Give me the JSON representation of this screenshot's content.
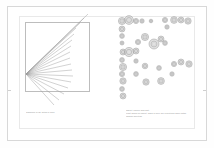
{
  "document": {
    "title": "Figure page",
    "background_color": "#ffffff",
    "frame_color": "#d8d8d8"
  },
  "left_panel": {
    "name": "ray-diagram-panel",
    "box": {
      "stroke_color": "#bdbdbd",
      "fill_color": "#ffffff"
    },
    "ray_origin": {
      "x": 12,
      "y": 62
    },
    "ray_color": "#9a9a9a",
    "rays": [
      {
        "x2": 74,
        "y2": 2
      },
      {
        "x2": 70,
        "y2": 6
      },
      {
        "x2": 66,
        "y2": 11
      },
      {
        "x2": 62,
        "y2": 16
      },
      {
        "x2": 60,
        "y2": 22
      },
      {
        "x2": 58,
        "y2": 28
      },
      {
        "x2": 57,
        "y2": 34
      },
      {
        "x2": 56,
        "y2": 40
      },
      {
        "x2": 56,
        "y2": 46
      },
      {
        "x2": 57,
        "y2": 52
      },
      {
        "x2": 58,
        "y2": 58
      },
      {
        "x2": 59,
        "y2": 64
      },
      {
        "x2": 57,
        "y2": 70
      },
      {
        "x2": 54,
        "y2": 76
      },
      {
        "x2": 50,
        "y2": 82
      },
      {
        "x2": 45,
        "y2": 88
      },
      {
        "x2": 40,
        "y2": 93
      }
    ],
    "caption": "Sampling a ray within a cone"
  },
  "right_panel": {
    "name": "bubble-scatter-panel",
    "bubble_color": "#9b9b9b",
    "bubble_fill": "#c9c9c9",
    "bubbles": [
      {
        "cx": 10,
        "cy": 9,
        "r": 3.6
      },
      {
        "cx": 17,
        "cy": 8,
        "r": 4.4
      },
      {
        "cx": 24,
        "cy": 9,
        "r": 2.6
      },
      {
        "cx": 30,
        "cy": 9,
        "r": 2.2
      },
      {
        "cx": 39,
        "cy": 9,
        "r": 1.8
      },
      {
        "cx": 10,
        "cy": 17,
        "r": 3.0
      },
      {
        "cx": 10,
        "cy": 24,
        "r": 2.4
      },
      {
        "cx": 10,
        "cy": 31,
        "r": 2.0
      },
      {
        "cx": 53,
        "cy": 8,
        "r": 2.6
      },
      {
        "cx": 62,
        "cy": 8,
        "r": 3.4
      },
      {
        "cx": 69,
        "cy": 8,
        "r": 3.0
      },
      {
        "cx": 76,
        "cy": 9,
        "r": 3.2
      },
      {
        "cx": 55,
        "cy": 15,
        "r": 2.2
      },
      {
        "cx": 11,
        "cy": 40,
        "r": 3.0
      },
      {
        "cx": 17,
        "cy": 40,
        "r": 4.6
      },
      {
        "cx": 24,
        "cy": 39,
        "r": 3.0
      },
      {
        "cx": 10,
        "cy": 48,
        "r": 2.4
      },
      {
        "cx": 11,
        "cy": 55,
        "r": 3.6
      },
      {
        "cx": 10,
        "cy": 62,
        "r": 2.6
      },
      {
        "cx": 11,
        "cy": 69,
        "r": 3.2
      },
      {
        "cx": 10,
        "cy": 77,
        "r": 2.4
      },
      {
        "cx": 11,
        "cy": 84,
        "r": 3.0
      },
      {
        "cx": 24,
        "cy": 49,
        "r": 2.2
      },
      {
        "cx": 24,
        "cy": 62,
        "r": 2.4
      },
      {
        "cx": 33,
        "cy": 54,
        "r": 2.8
      },
      {
        "cx": 34,
        "cy": 70,
        "r": 3.2
      },
      {
        "cx": 42,
        "cy": 32,
        "r": 5.0
      },
      {
        "cx": 49,
        "cy": 27,
        "r": 3.0
      },
      {
        "cx": 53,
        "cy": 31,
        "r": 2.4
      },
      {
        "cx": 33,
        "cy": 25,
        "r": 3.6
      },
      {
        "cx": 26,
        "cy": 30,
        "r": 2.6
      },
      {
        "cx": 47,
        "cy": 56,
        "r": 2.4
      },
      {
        "cx": 49,
        "cy": 69,
        "r": 3.4
      },
      {
        "cx": 62,
        "cy": 52,
        "r": 2.6
      },
      {
        "cx": 69,
        "cy": 50,
        "r": 3.0
      },
      {
        "cx": 77,
        "cy": 52,
        "r": 3.2
      },
      {
        "cx": 60,
        "cy": 62,
        "r": 2.2
      }
    ],
    "caption_lines": [
      "Object, source and light",
      "Light falling on object. Rays in grey are reflections while paths",
      "change direction"
    ]
  }
}
